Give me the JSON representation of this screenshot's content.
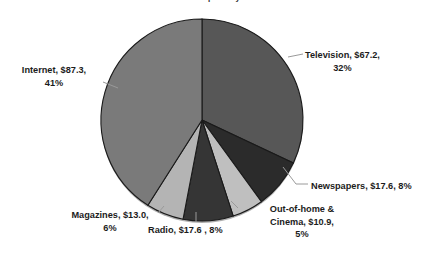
{
  "chart_data": {
    "type": "pie",
    "title": "Global ad spend by medium",
    "unit": "$ billions",
    "categories": [
      "Television",
      "Internet",
      "Newspapers",
      "Out-of-home & Cinema",
      "Radio",
      "Magazines"
    ],
    "values": [
      67.2,
      87.3,
      17.6,
      10.9,
      17.6,
      13.0
    ],
    "percents": [
      32,
      41,
      8,
      5,
      8,
      6
    ],
    "legend": "none",
    "grid": false,
    "xlabel": "",
    "ylabel": "",
    "slices": [
      {
        "name": "television",
        "label_line1": "Television, $67.2,",
        "label_line2": "32%",
        "value": 67.2,
        "percent": 32,
        "color": "#575757",
        "start_deg": 0,
        "sweep_deg": 115.2
      },
      {
        "name": "newspapers",
        "label_line1": "Newspapers, $17.6, 8%",
        "label_line2": "",
        "value": 17.6,
        "percent": 8,
        "color": "#2b2b2b",
        "start_deg": 115.2,
        "sweep_deg": 28.8
      },
      {
        "name": "out-of-home-and-cinema",
        "label_line1": "Out-of-home &",
        "label_line2": "Cinema, $10.9,",
        "label_line3": "5%",
        "value": 10.9,
        "percent": 5,
        "color": "#bfbfbf",
        "start_deg": 144.0,
        "sweep_deg": 18.0
      },
      {
        "name": "radio",
        "label_line1": "Radio, $17.6 , 8%",
        "label_line2": "",
        "value": 17.6,
        "percent": 8,
        "color": "#353535",
        "start_deg": 162.0,
        "sweep_deg": 28.8
      },
      {
        "name": "magazines",
        "label_line1": "Magazines, $13.0,",
        "label_line2": "6%",
        "value": 13.0,
        "percent": 6,
        "color": "#b4b4b4",
        "start_deg": 190.8,
        "sweep_deg": 21.6
      },
      {
        "name": "internet",
        "label_line1": "Internet, $87.3,",
        "label_line2": "41%",
        "value": 87.3,
        "percent": 41,
        "color": "#7a7a7a",
        "start_deg": 212.4,
        "sweep_deg": 147.6
      }
    ],
    "colors": {
      "background": "#ffffff",
      "slice_border": "#1a1a1a",
      "label_text": "#1c1c1c",
      "leader_line": "#9a9a9a"
    }
  }
}
